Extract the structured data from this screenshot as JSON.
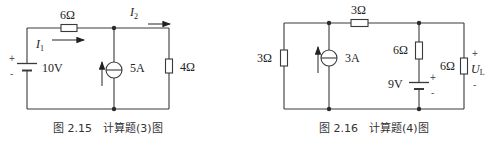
{
  "figures": [
    {
      "id": "fig-2-15",
      "caption": "图 2.15　计算题(3)图",
      "components": {
        "r_top": "6Ω",
        "voltage_source": "10V",
        "current_source": "5A",
        "r_right": "4Ω"
      },
      "currents": {
        "i1_main": "I",
        "i1_sub": "1",
        "i2_main": "I",
        "i2_sub": "2"
      },
      "polarity": {
        "plus": "+",
        "minus": "-"
      }
    },
    {
      "id": "fig-2-16",
      "caption": "图 2.16　计算题(4)图",
      "components": {
        "r_left": "3Ω",
        "current_source": "3A",
        "r_top": "3Ω",
        "r_mid": "6Ω",
        "voltage_source": "9V",
        "r_load": "6Ω"
      },
      "load_voltage": {
        "main": "U",
        "sub": "L"
      },
      "polarity": {
        "plus": "+",
        "minus": "-",
        "load_plus": "+",
        "load_minus": "-"
      }
    }
  ],
  "colors": {
    "line": "#3a3a3a",
    "text": "#222222",
    "background": "#ffffff"
  }
}
